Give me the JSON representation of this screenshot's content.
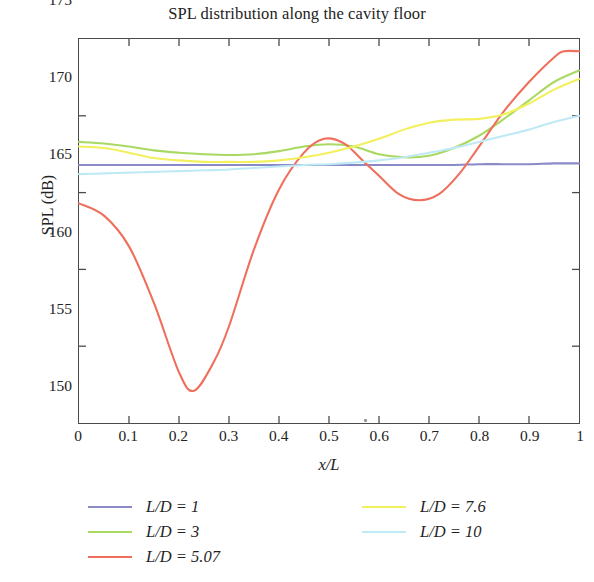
{
  "chart_data": {
    "type": "line",
    "title": "SPL distribution along the cavity floor",
    "xlabel": "x/L",
    "ylabel": "SPL (dB)",
    "xlim": [
      0,
      1
    ],
    "ylim": [
      150,
      175
    ],
    "xticks": [
      "0",
      "0.1",
      "0.2",
      "0.3",
      "0.4",
      "0.5",
      "0.6",
      "0.7",
      "0.8",
      "0.9",
      "1"
    ],
    "xtick_values": [
      0,
      0.1,
      0.2,
      0.3,
      0.4,
      0.5,
      0.6,
      0.7,
      0.8,
      0.9,
      1
    ],
    "yticks": [
      "175",
      "170",
      "165",
      "160",
      "155",
      "150"
    ],
    "ytick_values": [
      175,
      170,
      165,
      160,
      155,
      150
    ],
    "grid": false,
    "legend_position": "below-plot-two-columns",
    "series": [
      {
        "name": "L/D = 1",
        "color": "#8a8ac8",
        "x": [
          0,
          0.05,
          0.1,
          0.15,
          0.2,
          0.25,
          0.3,
          0.35,
          0.4,
          0.45,
          0.5,
          0.55,
          0.6,
          0.65,
          0.7,
          0.75,
          0.8,
          0.85,
          0.9,
          0.95,
          1
        ],
        "values": [
          166.8,
          166.8,
          166.8,
          166.8,
          166.8,
          166.8,
          166.8,
          166.8,
          166.8,
          166.8,
          166.8,
          166.8,
          166.8,
          166.8,
          166.8,
          166.8,
          166.85,
          166.85,
          166.85,
          166.9,
          166.9
        ]
      },
      {
        "name": "L/D = 3",
        "color": "#a9d962",
        "x": [
          0,
          0.05,
          0.1,
          0.15,
          0.2,
          0.25,
          0.3,
          0.35,
          0.4,
          0.45,
          0.5,
          0.55,
          0.6,
          0.65,
          0.7,
          0.75,
          0.8,
          0.85,
          0.9,
          0.95,
          1
        ],
        "values": [
          168.3,
          168.2,
          168.0,
          167.75,
          167.6,
          167.5,
          167.45,
          167.5,
          167.7,
          168.0,
          168.15,
          168.0,
          167.5,
          167.3,
          167.4,
          167.9,
          168.7,
          169.8,
          171.0,
          172.2,
          172.95
        ]
      },
      {
        "name": "L/D = 5.07",
        "color": "#ef6f5c",
        "x": [
          0,
          0.05,
          0.1,
          0.15,
          0.2,
          0.23,
          0.27,
          0.3,
          0.35,
          0.4,
          0.45,
          0.49,
          0.53,
          0.57,
          0.6,
          0.64,
          0.68,
          0.72,
          0.76,
          0.8,
          0.85,
          0.9,
          0.95,
          0.97,
          1
        ],
        "values": [
          164.3,
          163.5,
          161.5,
          157.8,
          153.3,
          152.1,
          154.0,
          156.3,
          161.3,
          165.2,
          167.6,
          168.5,
          168.2,
          167.0,
          166.1,
          164.9,
          164.5,
          164.9,
          166.2,
          168.0,
          170.3,
          172.2,
          173.8,
          174.2,
          174.2
        ]
      },
      {
        "name": "L/D = 7.6",
        "color": "#f2f05c",
        "x": [
          0,
          0.05,
          0.1,
          0.15,
          0.2,
          0.25,
          0.3,
          0.35,
          0.4,
          0.45,
          0.5,
          0.55,
          0.6,
          0.65,
          0.7,
          0.75,
          0.8,
          0.85,
          0.9,
          0.95,
          1
        ],
        "values": [
          168.0,
          167.9,
          167.6,
          167.25,
          167.1,
          167.0,
          167.0,
          167.0,
          167.1,
          167.3,
          167.6,
          168.0,
          168.5,
          169.1,
          169.55,
          169.75,
          169.8,
          170.1,
          170.8,
          171.7,
          172.4
        ]
      },
      {
        "name": "L/D = 10",
        "color": "#bfeaf5",
        "x": [
          0,
          0.05,
          0.1,
          0.15,
          0.2,
          0.25,
          0.3,
          0.35,
          0.4,
          0.45,
          0.5,
          0.55,
          0.6,
          0.65,
          0.7,
          0.75,
          0.8,
          0.85,
          0.9,
          0.95,
          1
        ],
        "values": [
          166.2,
          166.25,
          166.3,
          166.35,
          166.4,
          166.45,
          166.5,
          166.6,
          166.7,
          166.8,
          166.85,
          166.95,
          167.1,
          167.3,
          167.6,
          167.9,
          168.3,
          168.7,
          169.1,
          169.6,
          170.0
        ]
      }
    ]
  },
  "legend": {
    "columns": [
      {
        "items": [
          {
            "label": "L/D = 1",
            "color": "#8a8ac8"
          },
          {
            "label": "L/D = 3",
            "color": "#a9d962"
          },
          {
            "label": "L/D = 5.07",
            "color": "#ef6f5c"
          }
        ]
      },
      {
        "items": [
          {
            "label": "L/D = 7.6",
            "color": "#f2f05c"
          },
          {
            "label": "L/D = 10",
            "color": "#bfeaf5"
          }
        ]
      }
    ]
  }
}
